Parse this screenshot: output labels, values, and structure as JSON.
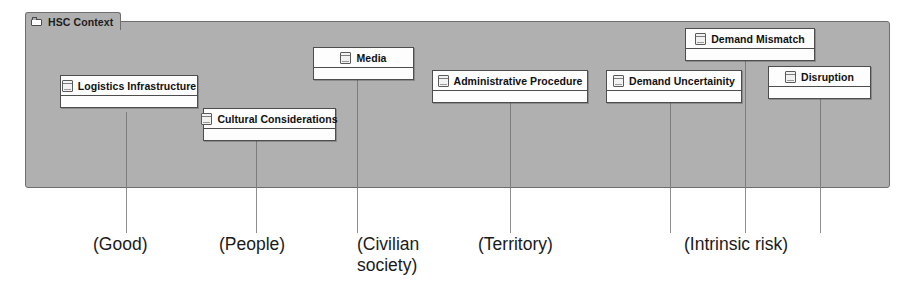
{
  "diagram": {
    "package": {
      "title": "HSC Context",
      "icon": "folder-icon",
      "fill_color": "#b0b0b0",
      "border_color": "#6e6e6e"
    },
    "node_icon": "uml-node-icon",
    "nodes": [
      {
        "label": "Logistics Infrastructure",
        "x": 60,
        "y": 75,
        "width": 138
      },
      {
        "label": "Cultural Considerations",
        "x": 203,
        "y": 108,
        "width": 133
      },
      {
        "label": "Media",
        "x": 313,
        "y": 47,
        "width": 101
      },
      {
        "label": "Administrative Procedure",
        "x": 432,
        "y": 70,
        "width": 156
      },
      {
        "label": "Demand Uncertainity",
        "x": 606,
        "y": 70,
        "width": 136
      },
      {
        "label": "Demand Mismatch",
        "x": 685,
        "y": 28,
        "width": 130
      },
      {
        "label": "Disruption",
        "x": 768,
        "y": 66,
        "width": 103
      }
    ],
    "leader_lines": [
      {
        "x": 126,
        "top": 112,
        "bottom": 233
      },
      {
        "x": 256,
        "top": 140,
        "bottom": 233
      },
      {
        "x": 357,
        "top": 79,
        "bottom": 233
      },
      {
        "x": 510,
        "top": 102,
        "bottom": 233
      },
      {
        "x": 670,
        "top": 102,
        "bottom": 233
      },
      {
        "x": 745,
        "top": 60,
        "bottom": 233
      },
      {
        "x": 820,
        "top": 98,
        "bottom": 233
      }
    ],
    "captions": [
      {
        "text": "(Good)",
        "x": 93,
        "y": 234,
        "width": 120
      },
      {
        "text": "(People)",
        "x": 219,
        "y": 234,
        "width": 120
      },
      {
        "text": "(Civilian\nsociety)",
        "x": 357,
        "y": 234,
        "width": 95
      },
      {
        "text": "(Territory)",
        "x": 478,
        "y": 234,
        "width": 130
      },
      {
        "text": "(Intrinsic risk)",
        "x": 684,
        "y": 234,
        "width": 160
      }
    ]
  }
}
